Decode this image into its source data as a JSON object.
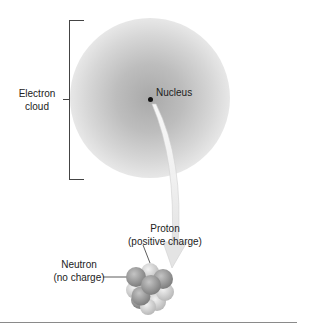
{
  "diagram": {
    "type": "atom-structure",
    "labels": {
      "electron_cloud_line1": "Electron",
      "electron_cloud_line2": "cloud",
      "nucleus": "Nucleus",
      "proton_line1": "Proton",
      "proton_line2": "(positive charge)",
      "neutron_line1": "Neutron",
      "neutron_line2": "(no charge)"
    },
    "colors": {
      "cloud_center": "#a9a9a9",
      "proton": "#d8d8d8",
      "neutron": "#9a9a9a",
      "bracket": "#444444",
      "rule": "#8a8a8a"
    }
  }
}
